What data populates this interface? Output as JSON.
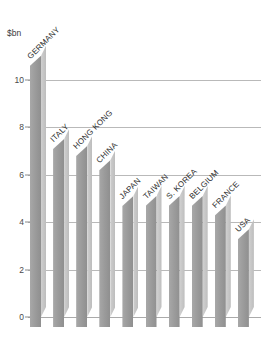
{
  "chart_data": {
    "type": "bar",
    "title": "",
    "subtitle": "",
    "xlabel": "",
    "ylabel": "$bn",
    "unit_caption": "$bn",
    "ylim": [
      0,
      11.6
    ],
    "yticks": [
      0,
      2,
      4,
      6,
      8,
      10
    ],
    "ytick_labels": [
      "0",
      "2",
      "4",
      "6",
      "8",
      "10"
    ],
    "grid": true,
    "legend": false,
    "legend_position": "none",
    "categories": [
      "GERMANY",
      "ITALY",
      "HONG KONG",
      "CHINA",
      "JAPAN",
      "TAIWAN",
      "S. KOREA",
      "BELGIUM",
      "FRANCE",
      "USA"
    ],
    "values": [
      11.0,
      7.5,
      7.2,
      6.6,
      5.1,
      5.1,
      5.1,
      5.1,
      4.7,
      3.7
    ],
    "series": [
      {
        "name": "",
        "values": [
          11.0,
          7.5,
          7.2,
          6.6,
          5.1,
          5.1,
          5.1,
          5.1,
          4.7,
          3.7
        ]
      }
    ],
    "colors": {
      "bar_front": "#9c9c9c",
      "bar_side": "#c6c6c6",
      "gridline": "#b9b9b9",
      "text": "#2e2e2e",
      "background": "#ffffff"
    }
  }
}
